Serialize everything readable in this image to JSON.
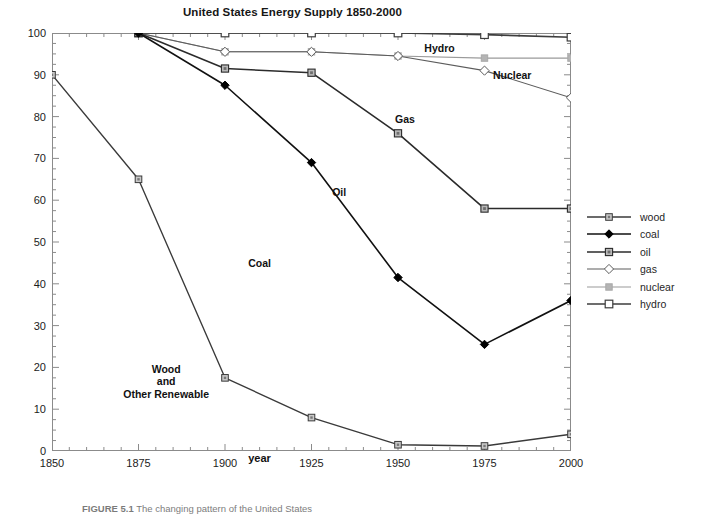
{
  "chart_data": {
    "type": "line",
    "title": "United States Energy Supply 1850-2000",
    "xlabel": "year",
    "ylabel": "Energy Supply, percent",
    "xlim": [
      1850,
      2000
    ],
    "ylim": [
      0,
      100
    ],
    "x_ticks": [
      1850,
      1875,
      1900,
      1925,
      1950,
      1975,
      2000
    ],
    "x_tick_labels": [
      "1850",
      "1875",
      "1900",
      "1925",
      "1950",
      "1975",
      "2000"
    ],
    "x_minor_tick_step": 5,
    "y_ticks": [
      0,
      10,
      20,
      30,
      40,
      50,
      60,
      70,
      80,
      90,
      100
    ],
    "y_tick_labels": [
      "0",
      "10",
      "20",
      "30",
      "40",
      "50",
      "60",
      "70",
      "80",
      "90",
      "100"
    ],
    "y_minor_tick_step": 2.5,
    "grid": false,
    "legend_position": "right",
    "note": "Cumulative percentage boundary lines; named bands lie between adjacent curves.",
    "x": [
      1850,
      1875,
      1900,
      1925,
      1950,
      1975,
      2000
    ],
    "series": [
      {
        "name": "wood",
        "label": "wood",
        "marker": "small-square",
        "color": "#3a3a3a",
        "marker_fill": "#c9c9c9",
        "x": [
          1850,
          1875,
          1900,
          1925,
          1950,
          1975,
          2000
        ],
        "values": [
          90,
          65,
          17.5,
          8,
          1.5,
          1.2,
          4
        ]
      },
      {
        "name": "coal",
        "label": "coal",
        "marker": "filled-diamond",
        "color": "#111111",
        "marker_fill": "#000000",
        "x": [
          1875,
          1900,
          1925,
          1950,
          1975,
          2000
        ],
        "values": [
          100,
          87.5,
          69,
          41.5,
          25.5,
          36
        ]
      },
      {
        "name": "oil",
        "label": "oil",
        "marker": "square",
        "color": "#2b2b2b",
        "marker_fill": "#b9b9b9",
        "x": [
          1875,
          1900,
          1925,
          1950,
          1975,
          2000
        ],
        "values": [
          100,
          91.5,
          90.5,
          76,
          58,
          58
        ]
      },
      {
        "name": "gas",
        "label": "gas",
        "marker": "open-diamond",
        "color": "#5c5c5c",
        "marker_fill": "#ffffff",
        "x": [
          1875,
          1900,
          1925,
          1950,
          1975,
          2000
        ],
        "values": [
          100,
          95.5,
          95.5,
          94.5,
          91,
          84.5
        ]
      },
      {
        "name": "nuclear",
        "label": "nuclear",
        "marker": "small-square-light",
        "color": "#9a9a9a",
        "marker_fill": "#b4b4b4",
        "x": [
          1875,
          1900,
          1925,
          1950,
          1975,
          2000
        ],
        "values": [
          100,
          95.5,
          95.5,
          94.5,
          94,
          94
        ]
      },
      {
        "name": "hydro",
        "label": "hydro",
        "marker": "open-square",
        "color": "#3d3d3d",
        "marker_fill": "#ffffff",
        "x": [
          1875,
          1900,
          1925,
          1950,
          1975,
          2000
        ],
        "values": [
          100,
          100,
          100,
          100,
          99.6,
          99
        ]
      }
    ],
    "annotations": [
      {
        "text": "Wood\nand\nOther Renewable",
        "x": 1883,
        "y": 16.5,
        "name": "wood-band-label"
      },
      {
        "text": "Coal",
        "x": 1910,
        "y": 45,
        "name": "coal-band-label"
      },
      {
        "text": "Oil",
        "x": 1933,
        "y": 62,
        "name": "oil-band-label"
      },
      {
        "text": "Gas",
        "x": 1952,
        "y": 79.5,
        "name": "gas-band-label"
      },
      {
        "text": "Nuclear",
        "x": 1983,
        "y": 90,
        "name": "nuclear-band-label"
      },
      {
        "text": "Hydro",
        "x": 1962,
        "y": 96.5,
        "name": "hydro-band-label"
      }
    ]
  },
  "caption": {
    "figure_number": "FIGURE 5.1",
    "text": "The changing pattern of the United States"
  }
}
